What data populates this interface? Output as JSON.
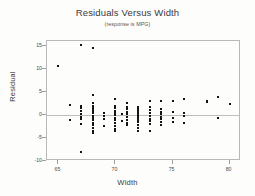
{
  "chart_data": {
    "type": "scatter",
    "title": "Residuals Versus Width",
    "subtitle": "(response is MPG)",
    "xlabel": "Width",
    "ylabel": "Residual",
    "xlim": [
      64,
      81
    ],
    "ylim": [
      -10,
      16
    ],
    "xticks": [
      65,
      70,
      75,
      80
    ],
    "yticks": [
      15,
      10,
      5,
      0,
      -5,
      -10
    ],
    "grid": false,
    "legend": null,
    "reference_line": 0,
    "series": [
      {
        "name": "Residuals",
        "points": [
          [
            65.0,
            10.5
          ],
          [
            66.0,
            2.2
          ],
          [
            66.0,
            -1.2
          ],
          [
            67.0,
            15.2
          ],
          [
            67.0,
            -8.0
          ],
          [
            67.0,
            2.0
          ],
          [
            67.0,
            1.4
          ],
          [
            67.0,
            0.8
          ],
          [
            67.0,
            0.2
          ],
          [
            67.0,
            -0.4
          ],
          [
            67.0,
            -1.0
          ],
          [
            67.0,
            -2.0
          ],
          [
            68.0,
            14.5
          ],
          [
            68.0,
            4.3
          ],
          [
            68.0,
            2.6
          ],
          [
            68.0,
            2.0
          ],
          [
            68.0,
            1.5
          ],
          [
            68.0,
            1.1
          ],
          [
            68.0,
            0.7
          ],
          [
            68.0,
            0.3
          ],
          [
            68.0,
            -0.2
          ],
          [
            68.0,
            -0.7
          ],
          [
            68.0,
            -1.2
          ],
          [
            68.0,
            -1.7
          ],
          [
            68.0,
            -2.2
          ],
          [
            68.0,
            -2.8
          ],
          [
            68.0,
            -3.4
          ],
          [
            68.0,
            -4.0
          ],
          [
            69.0,
            0.4
          ],
          [
            69.0,
            -0.2
          ],
          [
            69.0,
            -0.8
          ],
          [
            69.0,
            -2.4
          ],
          [
            70.0,
            3.4
          ],
          [
            70.0,
            2.0
          ],
          [
            70.0,
            1.4
          ],
          [
            70.0,
            0.9
          ],
          [
            70.0,
            0.4
          ],
          [
            70.0,
            -0.1
          ],
          [
            70.0,
            -0.6
          ],
          [
            70.0,
            -1.2
          ],
          [
            70.0,
            -1.8
          ],
          [
            70.0,
            -2.4
          ],
          [
            70.0,
            -3.0
          ],
          [
            70.0,
            -3.6
          ],
          [
            70.6,
            0.2
          ],
          [
            70.6,
            -1.4
          ],
          [
            71.0,
            2.6
          ],
          [
            71.0,
            1.8
          ],
          [
            71.0,
            1.2
          ],
          [
            71.0,
            0.6
          ],
          [
            71.0,
            0.1
          ],
          [
            71.0,
            -0.5
          ],
          [
            71.0,
            -1.1
          ],
          [
            71.0,
            -1.7
          ],
          [
            71.0,
            -2.3
          ],
          [
            72.0,
            1.8
          ],
          [
            72.0,
            1.3
          ],
          [
            72.0,
            0.9
          ],
          [
            72.0,
            0.5
          ],
          [
            72.0,
            0.1
          ],
          [
            72.0,
            -0.3
          ],
          [
            72.0,
            -0.7
          ],
          [
            72.0,
            -1.1
          ],
          [
            72.0,
            -1.6
          ],
          [
            72.0,
            -2.1
          ],
          [
            72.0,
            -2.8
          ],
          [
            72.0,
            -3.6
          ],
          [
            73.0,
            2.9
          ],
          [
            73.0,
            1.6
          ],
          [
            73.0,
            1.0
          ],
          [
            73.0,
            0.4
          ],
          [
            73.0,
            -0.2
          ],
          [
            73.0,
            -0.8
          ],
          [
            73.0,
            -1.4
          ],
          [
            73.0,
            -2.0
          ],
          [
            73.0,
            -3.6
          ],
          [
            74.0,
            3.0
          ],
          [
            74.0,
            1.2
          ],
          [
            74.0,
            0.7
          ],
          [
            74.0,
            0.2
          ],
          [
            74.0,
            -0.4
          ],
          [
            74.0,
            -1.0
          ],
          [
            74.0,
            -1.6
          ],
          [
            74.0,
            -2.2
          ],
          [
            75.0,
            3.1
          ],
          [
            75.0,
            0.6
          ],
          [
            75.0,
            -0.6
          ],
          [
            75.0,
            -1.6
          ],
          [
            76.0,
            3.4
          ],
          [
            76.0,
            0.5
          ],
          [
            76.0,
            -0.2
          ],
          [
            76.0,
            -1.8
          ],
          [
            78.0,
            3.0
          ],
          [
            78.0,
            2.8
          ],
          [
            79.0,
            3.9
          ],
          [
            79.0,
            -0.7
          ],
          [
            80.0,
            2.4
          ]
        ]
      }
    ]
  },
  "axis": {
    "y_labels": [
      "15",
      "10",
      "5",
      "0",
      "-5",
      "-10"
    ],
    "x_labels": [
      "65",
      "70",
      "75",
      "80"
    ]
  },
  "colors": {
    "point": "#141414",
    "frame": "#b9b9b9",
    "zeroline": "#bdbdbd",
    "text": "#3a3a3a"
  }
}
